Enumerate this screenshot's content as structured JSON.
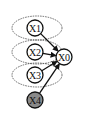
{
  "diagram": {
    "type": "graphical-model",
    "nodes": [
      {
        "id": "X1",
        "label": "X1",
        "x": 35,
        "y": 28,
        "shaded": false
      },
      {
        "id": "X2",
        "label": "X2",
        "x": 35,
        "y": 52,
        "shaded": false
      },
      {
        "id": "X3",
        "label": "X3",
        "x": 35,
        "y": 75,
        "shaded": false
      },
      {
        "id": "X4",
        "label": "X4",
        "x": 35,
        "y": 100,
        "shaded": true
      },
      {
        "id": "X0",
        "label": "X0",
        "x": 64,
        "y": 57,
        "shaded": false
      }
    ],
    "edges": [
      {
        "from": "X1",
        "to": "X0"
      },
      {
        "from": "X2",
        "to": "X0"
      },
      {
        "from": "X3",
        "to": "X0"
      },
      {
        "from": "X4",
        "to": "X0"
      }
    ],
    "groups": [
      {
        "name": "ellipse-x1",
        "cx": 37,
        "cy": 28,
        "rx": 25,
        "ry": 12
      },
      {
        "name": "ellipse-x2",
        "cx": 37,
        "cy": 52,
        "rx": 25,
        "ry": 12
      },
      {
        "name": "ellipse-x3",
        "cx": 37,
        "cy": 75,
        "rx": 25,
        "ry": 12
      }
    ],
    "colors": {
      "stroke": "#111111",
      "shaded_fill": "#8a8a8a",
      "fill": "#ffffff",
      "dashed": "#444444"
    }
  }
}
